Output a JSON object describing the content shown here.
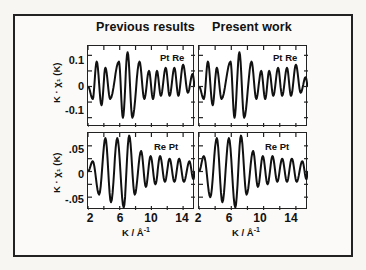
{
  "chart_data": {
    "type": "line",
    "layout": "2x2 grid of panels",
    "columns": [
      "Previous results",
      "Present work"
    ],
    "rows": [
      {
        "edge": "Pt Re",
        "ylabel": "K · χ1 (K)",
        "yticks": [
          "0.1",
          "0",
          "-0.1"
        ],
        "ylim": [
          -0.13,
          0.13
        ]
      },
      {
        "edge": "Re Pt",
        "ylabel": "K · χ1 (K)",
        "yticks": [
          ".05",
          "0",
          "-.05"
        ],
        "ylim": [
          -0.075,
          0.075
        ]
      }
    ],
    "xlabel": "K / Å⁻¹",
    "xticks": [
      "2",
      "6",
      "10",
      "14"
    ],
    "xlim": [
      2,
      15.5
    ],
    "grid": false,
    "legend": "none",
    "panels": [
      {
        "column": "Previous results",
        "row": "Pt Re",
        "peaks_x": [
          3.1,
          4.2,
          5.9,
          7.0,
          8.5,
          9.7,
          10.7,
          11.8,
          12.9,
          14.0,
          15.2
        ],
        "peaks_y": [
          0.08,
          0.06,
          0.08,
          0.11,
          0.08,
          0.05,
          0.05,
          0.06,
          0.06,
          0.07,
          0.04
        ],
        "troughs_x": [
          2.6,
          3.7,
          4.8,
          6.4,
          7.6,
          9.1,
          10.2,
          11.2,
          12.3,
          13.4,
          14.6
        ],
        "troughs_y": [
          -0.04,
          -0.06,
          -0.04,
          -0.1,
          -0.1,
          -0.04,
          -0.04,
          -0.03,
          -0.03,
          -0.03,
          -0.02
        ]
      },
      {
        "column": "Present work",
        "row": "Pt Re",
        "peaks_x": [
          3.1,
          4.2,
          5.9,
          7.0,
          8.5,
          9.7,
          10.7,
          11.8,
          12.9,
          14.0,
          15.2
        ],
        "peaks_y": [
          0.08,
          0.06,
          0.08,
          0.11,
          0.08,
          0.05,
          0.05,
          0.06,
          0.06,
          0.07,
          0.03
        ],
        "troughs_x": [
          2.6,
          3.7,
          4.8,
          6.4,
          7.6,
          9.1,
          10.2,
          11.2,
          12.3,
          13.4,
          14.6
        ],
        "troughs_y": [
          -0.04,
          -0.06,
          -0.04,
          -0.1,
          -0.1,
          -0.04,
          -0.04,
          -0.03,
          -0.03,
          -0.03,
          -0.02
        ]
      },
      {
        "column": "Previous results",
        "row": "Re Pt",
        "peaks_x": [
          2.6,
          4.2,
          5.7,
          7.2,
          8.7,
          9.9,
          11.1,
          12.3,
          13.5,
          14.8
        ],
        "peaks_y": [
          0.02,
          0.065,
          0.065,
          0.07,
          0.04,
          0.03,
          0.03,
          0.025,
          0.025,
          0.02
        ],
        "troughs_x": [
          3.4,
          4.9,
          6.5,
          7.9,
          9.3,
          10.5,
          11.7,
          12.9,
          14.1,
          15.3
        ],
        "troughs_y": [
          -0.045,
          -0.06,
          -0.07,
          -0.045,
          -0.03,
          -0.025,
          -0.02,
          -0.02,
          -0.02,
          -0.015
        ]
      },
      {
        "column": "Present work",
        "row": "Re Pt",
        "peaks_x": [
          2.6,
          4.2,
          5.7,
          7.2,
          8.7,
          9.9,
          11.1,
          12.3,
          13.5,
          14.8
        ],
        "peaks_y": [
          0.03,
          0.065,
          0.065,
          0.07,
          0.04,
          0.03,
          0.03,
          0.025,
          0.025,
          0.02
        ],
        "troughs_x": [
          3.4,
          4.9,
          6.5,
          7.9,
          9.3,
          10.5,
          11.7,
          12.9,
          14.1,
          15.3
        ],
        "troughs_y": [
          -0.05,
          -0.06,
          -0.07,
          -0.045,
          -0.03,
          -0.025,
          -0.02,
          -0.02,
          -0.02,
          -0.015
        ]
      }
    ]
  },
  "titles": {
    "left": "Previous results",
    "right": "Present work"
  },
  "labels": {
    "top_edge": "Pt Re",
    "bottom_edge": "Re Pt",
    "ylabel": "K · χ₁ (K)",
    "xlabel_base": "K / Å",
    "xlabel_sup": "-1"
  },
  "yticks_top": {
    "hi": "0.1",
    "mid": "0",
    "lo": "-0.1"
  },
  "yticks_bottom": {
    "hi": ".05",
    "mid": "0",
    "lo": "-.05"
  },
  "xticks": {
    "a": "2",
    "b": "6",
    "c": "10",
    "d": "14"
  }
}
